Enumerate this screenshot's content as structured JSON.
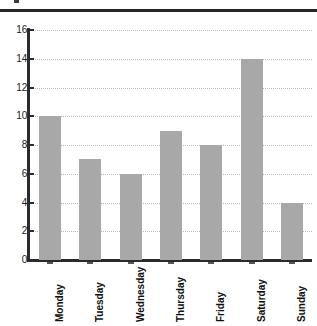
{
  "chart_data": {
    "type": "bar",
    "title": "",
    "subtitle": "",
    "xlabel": "",
    "ylabel": "",
    "categories": [
      "Monday",
      "Tuesday",
      "Wednesday",
      "Thursday",
      "Friday",
      "Saturday",
      "Sunday"
    ],
    "values": [
      10,
      7,
      6,
      9,
      8,
      14,
      4
    ],
    "ylim": [
      0,
      16
    ],
    "yticks": [
      0,
      2,
      4,
      6,
      8,
      10,
      12,
      14,
      16
    ],
    "ytick_labels": [
      "0",
      "2",
      "4",
      "6",
      "8",
      "10",
      "12",
      "14",
      "16"
    ],
    "grid": true,
    "grid_axis": "y",
    "grid_style": "dotted",
    "legend": false,
    "legend_position": "none",
    "bar_color": "#a8a8a8",
    "axis_color": "#2b2b2b",
    "grid_color": "#b9b9b9",
    "background_color": "#ffffff",
    "xtick_label_rotation": 90,
    "series": [
      {
        "name": "",
        "values": [
          10,
          7,
          6,
          9,
          8,
          14,
          4
        ]
      }
    ]
  },
  "decor": {
    "top_rule_color": "#272727"
  }
}
